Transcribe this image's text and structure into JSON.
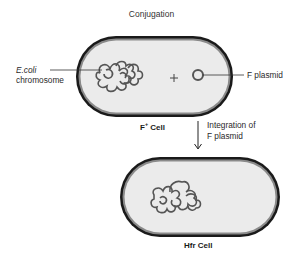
{
  "title": "Conjugation",
  "top_cell": {
    "name": "F+ Cell",
    "label_main": "F",
    "label_sup": "+",
    "label_rest": " Cell",
    "chromosome_label_line1": "E.coli",
    "chromosome_label_line2": "chromosome",
    "plus_sign": "+",
    "plasmid_label": "F plasmid"
  },
  "transition": {
    "line1": "Integration of",
    "line2": "F plasmid",
    "arrow": "down-arrow"
  },
  "bottom_cell": {
    "name": "Hfr Cell"
  },
  "colors": {
    "cell_outline": "#1a1a1a",
    "cell_inner_ring": "#8a8a8a",
    "cytoplasm": "#ebebeb",
    "dna": "#555555"
  }
}
